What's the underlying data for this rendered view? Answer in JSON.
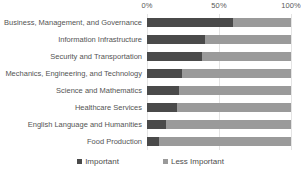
{
  "chart_data": {
    "type": "bar",
    "orientation": "horizontal",
    "stacked": true,
    "normalized": "100%",
    "title": "",
    "subtitle": "",
    "xlabel": "",
    "ylabel": "",
    "xlim": [
      0,
      100
    ],
    "grid": true,
    "legend_position": "bottom",
    "categories": [
      "Business,  Management, and Governance",
      "Information Infrastructure",
      "Security and Transportation",
      "Mechanics, Engineering, and Technology",
      "Science and Mathematics",
      "Healthcare Services",
      "English Language and Humanities",
      "Food Production"
    ],
    "series": [
      {
        "name": "Important",
        "color": "#4a4a4a",
        "values": [
          60,
          40,
          38,
          24,
          22,
          21,
          13,
          8
        ]
      },
      {
        "name": "Less Important",
        "color": "#9a9a9a",
        "values": [
          40,
          60,
          62,
          76,
          78,
          79,
          87,
          92
        ]
      }
    ],
    "xticks": [
      0,
      50,
      100
    ],
    "xticklabels": [
      "0%",
      "50%",
      "100%"
    ]
  },
  "legend": {
    "items": [
      {
        "label": "Important",
        "color": "#4a4a4a"
      },
      {
        "label": "Less Important",
        "color": "#9a9a9a"
      }
    ]
  },
  "colors": {
    "important": "#4a4a4a",
    "less_important": "#9a9a9a",
    "gridline": "#e4e4e4",
    "text": "#545454",
    "background": "#ffffff"
  }
}
